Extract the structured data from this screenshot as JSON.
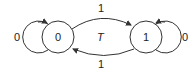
{
  "diagram": {
    "type": "state-transition",
    "states": [
      {
        "id": "s0",
        "label": "0"
      },
      {
        "id": "s1",
        "label": "1"
      }
    ],
    "transitions": [
      {
        "from": "s0",
        "to": "s0",
        "label": "0"
      },
      {
        "from": "s0",
        "to": "s1",
        "label": "1"
      },
      {
        "from": "s1",
        "to": "s0",
        "label": "1"
      },
      {
        "from": "s1",
        "to": "s1",
        "label": "0"
      }
    ],
    "center_label": "T",
    "colors": {
      "stroke": "#333333",
      "text": "#222222",
      "background": "#ffffff"
    }
  }
}
